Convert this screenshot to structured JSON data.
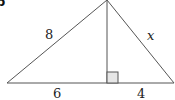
{
  "figure": {
    "part_label": "b",
    "labels": {
      "left_side": "8",
      "right_side": "x",
      "base_left": "6",
      "base_right": "4"
    },
    "colors": {
      "line": "#555555",
      "right_angle_fill": "#e6e6e6"
    }
  }
}
